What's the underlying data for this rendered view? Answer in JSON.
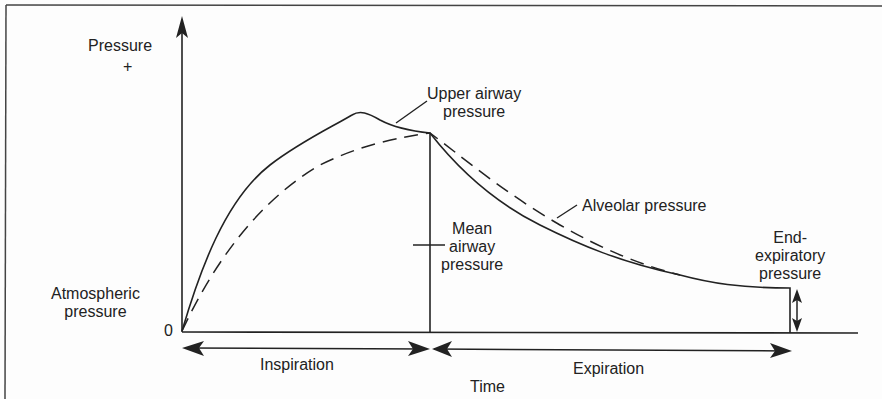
{
  "diagram": {
    "y_axis": {
      "label": "Pressure",
      "sign": "+",
      "origin": "0"
    },
    "x_axis": {
      "label": "Time"
    },
    "labels": {
      "atmospheric_line1": "Atmospheric",
      "atmospheric_line2": "pressure",
      "upper_airway_line1": "Upper airway",
      "upper_airway_line2": "pressure",
      "alveolar": "Alveolar pressure",
      "mean_line1": "Mean",
      "mean_line2": "airway",
      "mean_line3": "pressure",
      "end_exp_line1": "End-",
      "end_exp_line2": "expiratory",
      "end_exp_line3": "pressure"
    },
    "phases": {
      "inspiration": "Inspiration",
      "expiration": "Expiration"
    },
    "colors": {
      "ink": "#222222",
      "background": "#fdfdfd"
    }
  }
}
